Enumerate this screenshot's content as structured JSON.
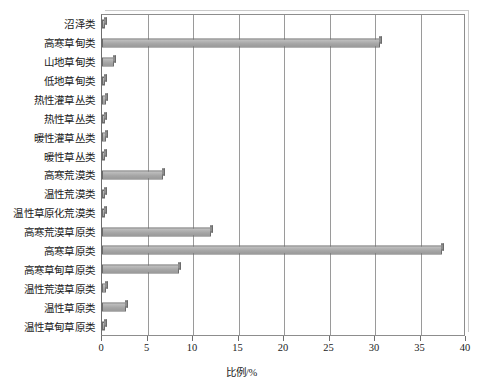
{
  "chart_data": {
    "type": "bar",
    "orientation": "horizontal",
    "title": "",
    "xlabel": "比例/%",
    "ylabel": "",
    "xlim": [
      0,
      40
    ],
    "xticks": [
      0,
      5,
      10,
      15,
      20,
      25,
      30,
      35,
      40
    ],
    "xtick_labels": [
      "0",
      "5",
      "10",
      "15",
      "20",
      "25",
      "30",
      "35",
      "40"
    ],
    "grid": "vertical",
    "legend": "none",
    "categories": [
      "沼泽类",
      "高寒草甸类",
      "山地草甸类",
      "低地草甸类",
      "热性灌草丛类",
      "热性草丛类",
      "暖性灌草丛类",
      "暖性草丛类",
      "高寒荒漠类",
      "温性荒漠类",
      "温性草原化荒漠类",
      "高寒荒漠草原类",
      "高寒草原类",
      "高寒草甸草原类",
      "温性荒漠草原类",
      "温性草原类",
      "温性草甸草原类"
    ],
    "values": [
      0.3,
      30.6,
      1.3,
      0.3,
      0.4,
      0.2,
      0.4,
      0.3,
      6.7,
      0.3,
      0.3,
      12.0,
      37.4,
      8.5,
      0.4,
      2.6,
      0.3
    ],
    "bar_fill_color": "#a8a8a8",
    "bar_edge_color": "#6b6b6b",
    "gridline_color": "#9a9a9a",
    "plot_border_color": "#8d8d8d",
    "background_color": "#ffffff"
  }
}
